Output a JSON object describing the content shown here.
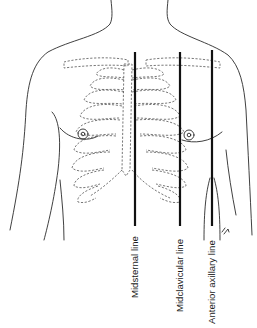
{
  "figure": {
    "colors": {
      "line": "#111111",
      "outline": "#2a2a2a",
      "ribs": "#555555",
      "background": "#ffffff"
    },
    "reference_lines": [
      {
        "label": "Midsternal line",
        "x": 135,
        "y_top": 52,
        "y_bottom": 226
      },
      {
        "label": "Midclavicular line",
        "x": 180,
        "y_top": 52,
        "y_bottom": 226
      },
      {
        "label": "Anterior axillary line",
        "x": 212,
        "y_top": 50,
        "y_bottom": 226
      }
    ],
    "signature": "r.h"
  }
}
